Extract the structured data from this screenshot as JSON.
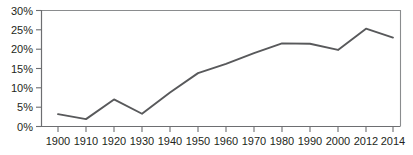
{
  "chart_data": {
    "type": "line",
    "title": "",
    "subtitle": "",
    "xlabel": "",
    "ylabel": "",
    "x": [
      "1900",
      "1910",
      "1920",
      "1930",
      "1940",
      "1950",
      "1960",
      "1970",
      "1980",
      "1990",
      "2000",
      "2012",
      "2014"
    ],
    "categories": [
      "1900",
      "1910",
      "1920",
      "1930",
      "1940",
      "1950",
      "1960",
      "1970",
      "1980",
      "1990",
      "2000",
      "2012",
      "2014"
    ],
    "values": [
      3.2,
      1.9,
      7.0,
      3.3,
      8.8,
      13.8,
      16.2,
      19.0,
      21.5,
      21.4,
      19.8,
      25.3,
      23.0
    ],
    "series": [
      {
        "name": "",
        "values": [
          3.2,
          1.9,
          7.0,
          3.3,
          8.8,
          13.8,
          16.2,
          19.0,
          21.5,
          21.4,
          19.8,
          25.3,
          23.0
        ]
      }
    ],
    "ylim": [
      0,
      30
    ],
    "ytick_values": [
      0,
      5,
      10,
      15,
      20,
      25,
      30
    ],
    "ytick_labels": [
      "0%",
      "5%",
      "10%",
      "15%",
      "20%",
      "25%",
      "30%"
    ],
    "xtick_labels": [
      "1900",
      "1910",
      "1920",
      "1930",
      "1940",
      "1950",
      "1960",
      "1970",
      "1980",
      "1990",
      "2000",
      "2012",
      "2014"
    ],
    "grid": false,
    "legend": false,
    "legend_position": "none",
    "annotations": [],
    "line_color": "#58595b",
    "axis_color": "#6d6e71",
    "frame_color": "#8a8c8e",
    "background_color": "#ffffff"
  },
  "axes": {
    "y": {
      "labels": [
        {
          "text": "30%",
          "value": 30
        },
        {
          "text": "25%",
          "value": 25
        },
        {
          "text": "20%",
          "value": 20
        },
        {
          "text": "15%",
          "value": 15
        },
        {
          "text": "10%",
          "value": 10
        },
        {
          "text": "5%",
          "value": 5
        },
        {
          "text": "0%",
          "value": 0
        }
      ]
    },
    "x": {
      "labels": [
        {
          "text": "1900"
        },
        {
          "text": "1910"
        },
        {
          "text": "1920"
        },
        {
          "text": "1930"
        },
        {
          "text": "1940"
        },
        {
          "text": "1950"
        },
        {
          "text": "1960"
        },
        {
          "text": "1970"
        },
        {
          "text": "1980"
        },
        {
          "text": "1990"
        },
        {
          "text": "2000"
        },
        {
          "text": "2012"
        },
        {
          "text": "2014"
        }
      ]
    }
  }
}
